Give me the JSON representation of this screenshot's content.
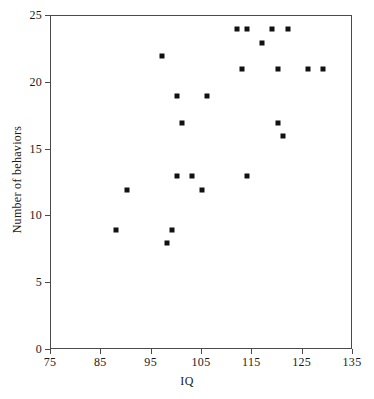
{
  "chart_data": {
    "type": "scatter",
    "title": "",
    "xlabel": "IQ",
    "ylabel": "Number of behaviors",
    "xlim": [
      75,
      135
    ],
    "ylim": [
      0,
      25
    ],
    "xticks": [
      75,
      85,
      95,
      105,
      115,
      125,
      135
    ],
    "yticks": [
      0,
      5,
      10,
      15,
      20,
      25
    ],
    "grid": false,
    "legend": null,
    "marker": "filled-square",
    "marker_color": "#111111",
    "frame_color": "#4a4a4a",
    "points": [
      {
        "x": 88,
        "y": 9
      },
      {
        "x": 90,
        "y": 12
      },
      {
        "x": 97,
        "y": 22
      },
      {
        "x": 98,
        "y": 8
      },
      {
        "x": 99,
        "y": 9
      },
      {
        "x": 100,
        "y": 19
      },
      {
        "x": 100,
        "y": 13
      },
      {
        "x": 101,
        "y": 17
      },
      {
        "x": 103,
        "y": 13
      },
      {
        "x": 105,
        "y": 12
      },
      {
        "x": 106,
        "y": 19
      },
      {
        "x": 112,
        "y": 24
      },
      {
        "x": 113,
        "y": 21
      },
      {
        "x": 114,
        "y": 24
      },
      {
        "x": 114,
        "y": 13
      },
      {
        "x": 117,
        "y": 23
      },
      {
        "x": 119,
        "y": 24
      },
      {
        "x": 120,
        "y": 21
      },
      {
        "x": 120,
        "y": 17
      },
      {
        "x": 121,
        "y": 16
      },
      {
        "x": 122,
        "y": 24
      },
      {
        "x": 126,
        "y": 21
      },
      {
        "x": 129,
        "y": 21
      }
    ]
  }
}
